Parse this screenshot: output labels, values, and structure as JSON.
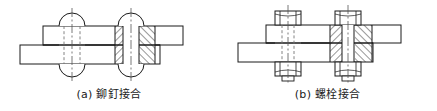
{
  "figure": {
    "title": "",
    "panels": [
      {
        "id": "rivet",
        "caption": "(a) 鉚釘接合",
        "label": "(a)",
        "name": "鉚釘接合",
        "fastener_type": "rivet",
        "view": "half-section",
        "description_left": "外形視圖（虛線表示隱藏孔）",
        "description_right": "剖面視圖（剖面線表示板材斷面）",
        "fastener_count": 2
      },
      {
        "id": "bolt",
        "caption": "(b) 螺栓接合",
        "label": "(b)",
        "name": "螺栓接合",
        "fastener_type": "bolt-and-nut",
        "view": "half-section",
        "description_left": "外形視圖（虛線表示隱藏螺紋）",
        "description_right": "剖面視圖（剖面線表示板材斷面）",
        "fastener_count": 2
      }
    ]
  },
  "style": {
    "line_color": "#1a1a1a",
    "hatch_color": "#1a1a1a",
    "center_line_color": "#555555",
    "hidden_line_color": "#777777",
    "background": "#ffffff",
    "plate_fill": "#ffffff",
    "line_width": "1",
    "thin_line_width": "0.7"
  },
  "geometry": {
    "rivet_panel": {
      "upper_plate": {
        "x": 43,
        "y": 26,
        "w": 140,
        "h": 19
      },
      "lower_plate": {
        "x": 20,
        "y": 45,
        "w": 140,
        "h": 19
      },
      "fastener_left_cx": 72,
      "fastener_right_cx": 131,
      "shank_half_width": 8,
      "head_arc_radius": 13
    },
    "bolt_panel": {
      "upper_plate": {
        "x": 48,
        "y": 25,
        "w": 135,
        "h": 18
      },
      "lower_plate": {
        "x": 20,
        "y": 43,
        "w": 135,
        "h": 19
      },
      "fastener_left_cx": 70,
      "fastener_right_cx": 130,
      "shank_half_width": 6,
      "nut_half_width": 13
    }
  }
}
